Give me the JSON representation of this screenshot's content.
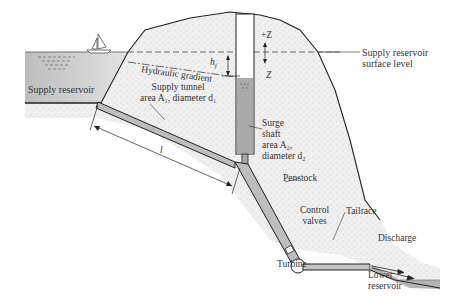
{
  "diagram": {
    "type": "hydroelectric surge shaft schematic",
    "labels": {
      "supply_reservoir": "Supply reservoir",
      "surface_level_line1": "Supply reservoir",
      "surface_level_line2": "surface level",
      "hydraulic_gradient": "Hydraulic gradient",
      "tunnel_line1": "Supply tunnel",
      "tunnel_line2": "area A₁, diameter d₁",
      "surge_line1": "Surge",
      "surge_line2": "shaft",
      "surge_line3": "area A₂,",
      "surge_line4": "diameter d₂",
      "penstock": "Penstock",
      "control_line1": "Control",
      "control_line2": "valves",
      "tailrace": "Tailrace",
      "discharge": "Discharge",
      "turbine": "Turbine",
      "lower_line1": "Lower",
      "lower_line2": "reservoir",
      "hf": "h",
      "hf_sub": "f",
      "plus_z": "+Z",
      "z": "Z",
      "length": "l"
    },
    "colors": {
      "water": "#c8c8c8",
      "rock": "#ededed",
      "outline": "#222222",
      "shaft_water": "#a9a9a9"
    }
  }
}
